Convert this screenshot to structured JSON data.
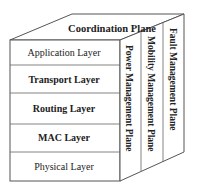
{
  "diagram": {
    "title_plane": "Coordination Plane",
    "layers": [
      {
        "label": "Application Layer",
        "bold": false
      },
      {
        "label": "Transport Layer",
        "bold": true
      },
      {
        "label": "Routing Layer",
        "bold": true
      },
      {
        "label": "MAC Layer",
        "bold": true
      },
      {
        "label": "Physical Layer",
        "bold": false
      }
    ],
    "planes": [
      {
        "label": "Power Management Plane"
      },
      {
        "label": "Mobility Management Plane"
      },
      {
        "label": "Fault Management Plane"
      }
    ],
    "colors": {
      "line": "#555555",
      "text": "#222222",
      "background": "#ffffff"
    }
  }
}
